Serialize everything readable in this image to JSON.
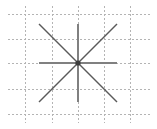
{
  "figure": {
    "width": 157,
    "height": 129,
    "background_color": "#ffffff",
    "title": "",
    "subtitle": ""
  },
  "chart_data": {
    "type": "line",
    "title": "",
    "subtitle": "",
    "xlabel": "",
    "ylabel": "",
    "xlim": [
      -2,
      2
    ],
    "ylim": [
      -2,
      2
    ],
    "grid": true,
    "grid_style": "dotted",
    "grid_color": "#b4b4b4",
    "legend": false,
    "legend_position": "none",
    "xticks": [
      -2,
      -1,
      0,
      1,
      2
    ],
    "yticks": [
      -2,
      -1,
      0,
      1,
      2
    ],
    "xtick_labels": [
      "",
      "",
      "",
      "",
      ""
    ],
    "ytick_labels": [
      "",
      "",
      "",
      "",
      ""
    ],
    "annotations": [],
    "series": [
      {
        "name": "horizontal",
        "angle_deg": 0,
        "color": "#808080",
        "line_width": 2,
        "x": [
          -1.5,
          1.5
        ],
        "y": [
          0,
          0
        ]
      },
      {
        "name": "vertical",
        "angle_deg": 90,
        "color": "#808080",
        "line_width": 2,
        "x": [
          0,
          0
        ],
        "y": [
          -1.5,
          1.5
        ]
      },
      {
        "name": "diagonal-rising",
        "angle_deg": 45,
        "color": "#5a5a5a",
        "line_width": 1.4,
        "x": [
          -1.5,
          1.5
        ],
        "y": [
          -1.5,
          1.5
        ]
      },
      {
        "name": "diagonal-falling",
        "angle_deg": 135,
        "color": "#5a5a5a",
        "line_width": 1.4,
        "x": [
          -1.5,
          1.5
        ],
        "y": [
          1.5,
          -1.5
        ]
      }
    ],
    "center_marker": {
      "x": 0,
      "y": 0,
      "color": "#3c3c3c",
      "size": 4
    },
    "pixel_geometry": {
      "center_x": 78,
      "center_y": 63,
      "extent": 52,
      "grid_x": [
        25,
        52,
        78,
        104,
        130
      ],
      "grid_y": [
        14,
        39,
        63,
        89,
        114
      ]
    }
  }
}
